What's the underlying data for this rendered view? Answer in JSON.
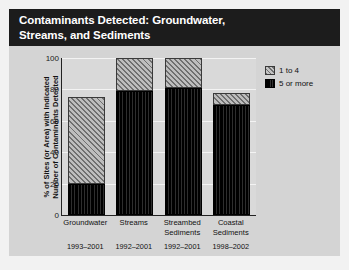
{
  "figure": {
    "title_lines": [
      "Contaminants Detected: Groundwater,",
      "Streams, and Sediments"
    ],
    "panel_bg": "#d4d4d4",
    "title_bg": "#1c1c1c",
    "title_color": "#ffffff"
  },
  "legend": {
    "position": "right",
    "items": [
      {
        "label": "1 to 4",
        "swatch": "hatched-gray",
        "color": "#8f8f8f"
      },
      {
        "label": "5 or more",
        "swatch": "solid-black",
        "color": "#141414"
      }
    ]
  },
  "chart_data": {
    "type": "bar",
    "stacked": true,
    "title": "Contaminants Detected: Groundwater, Streams, and Sediments",
    "xlabel": "",
    "ylabel": "% of Sites (or Area) with Indicated Number of Contaminants Detected",
    "ylabel_lines": [
      "% of Sites (or Area) with Indicated",
      "Number of Contaminants Detected"
    ],
    "ylim": [
      0,
      100
    ],
    "yticks": [
      0,
      20,
      40,
      60,
      80,
      100
    ],
    "ytick_labels": [
      "0",
      "20",
      "40",
      "60",
      "80",
      "100"
    ],
    "grid": true,
    "categories": [
      "Groundwater",
      "Streams",
      "Streambed Sediments",
      "Coastal Sediments"
    ],
    "category_lines": [
      [
        "Groundwater"
      ],
      [
        "Streams"
      ],
      [
        "Streambed",
        "Sediments"
      ],
      [
        "Coastal",
        "Sediments"
      ]
    ],
    "category_years": [
      "1993–2001",
      "1992–2001",
      "1992–2001",
      "1998–2002"
    ],
    "series": [
      {
        "name": "5 or more",
        "values": [
          20,
          79,
          81,
          70
        ]
      },
      {
        "name": "1 to 4",
        "values": [
          55,
          21,
          19,
          8
        ]
      }
    ],
    "totals": [
      75,
      100,
      100,
      78
    ]
  }
}
